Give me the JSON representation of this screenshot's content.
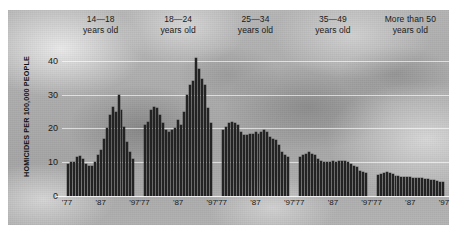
{
  "chart_data": {
    "type": "bar",
    "title": "",
    "xlabel": "",
    "ylabel": "HOMICIDES PER 100,000 PEOPLE",
    "ylim": [
      0,
      45
    ],
    "yticks": [
      0,
      10,
      20,
      30,
      40
    ],
    "grid": true,
    "legend_position": "none",
    "panel_headers": [
      {
        "line1": "14—18",
        "line2": "years old"
      },
      {
        "line1": "18—24",
        "line2": "years old"
      },
      {
        "line1": "25—34",
        "line2": "years old"
      },
      {
        "line1": "35—49",
        "line2": "years old"
      },
      {
        "line1": "More than 50",
        "line2": "years old"
      }
    ],
    "xtick_labels": [
      "'77",
      "'87",
      "'97"
    ],
    "x": [
      1976,
      1977,
      1978,
      1979,
      1980,
      1981,
      1982,
      1983,
      1984,
      1985,
      1986,
      1987,
      1988,
      1989,
      1990,
      1991,
      1992,
      1993,
      1994,
      1995,
      1996,
      1997,
      1998
    ],
    "series": [
      {
        "name": "14—18 years old",
        "values": [
          9.5,
          10.0,
          10.2,
          11.5,
          11.8,
          11.0,
          9.5,
          8.8,
          9.0,
          10.0,
          12.0,
          13.5,
          17.0,
          20.0,
          24.0,
          26.5,
          25.0,
          30.0,
          25.5,
          20.5,
          16.0,
          13.0,
          11.0
        ]
      },
      {
        "name": "18—24 years old",
        "values": [
          21.0,
          22.0,
          25.5,
          26.5,
          26.0,
          24.0,
          21.5,
          19.5,
          19.0,
          19.5,
          20.0,
          22.5,
          21.0,
          25.0,
          30.0,
          33.0,
          34.0,
          41.0,
          37.5,
          34.5,
          33.0,
          26.0,
          21.5
        ]
      },
      {
        "name": "25—34 years old",
        "values": [
          19.5,
          20.5,
          21.5,
          22.0,
          21.5,
          21.0,
          19.0,
          18.0,
          18.0,
          18.5,
          18.5,
          19.0,
          18.5,
          19.0,
          19.5,
          19.0,
          17.5,
          17.0,
          16.5,
          15.0,
          13.0,
          12.0,
          11.5
        ]
      },
      {
        "name": "35—49 years old",
        "values": [
          11.5,
          12.0,
          12.5,
          13.0,
          12.5,
          12.0,
          11.0,
          10.5,
          10.0,
          10.0,
          10.0,
          10.5,
          10.0,
          10.5,
          10.5,
          10.5,
          10.0,
          9.5,
          9.0,
          8.5,
          7.5,
          7.0,
          6.8
        ]
      },
      {
        "name": "More than 50 years old",
        "values": [
          6.3,
          6.5,
          6.8,
          7.0,
          6.8,
          6.5,
          6.0,
          5.8,
          5.6,
          5.6,
          5.6,
          5.6,
          5.4,
          5.4,
          5.4,
          5.3,
          5.0,
          4.9,
          4.7,
          4.6,
          4.3,
          4.2,
          4.1
        ]
      }
    ]
  },
  "colors": {
    "bar": "#232323",
    "gridline": "#ffffff",
    "text": "#1a1a1a",
    "plate_background": "#b0b0b0"
  }
}
